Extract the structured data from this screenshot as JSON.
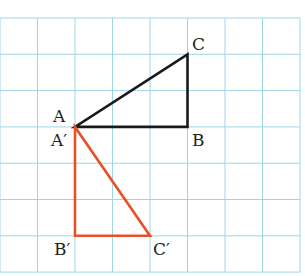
{
  "diagram": {
    "type": "grid-transformation",
    "grid": {
      "columns": 8,
      "rows": 7,
      "origin_px": [
        0,
        18
      ],
      "cell_w": 37.5,
      "cell_h": 36.3,
      "line_color": "#9fd6e6"
    },
    "triangles": [
      {
        "name": "ABC",
        "color": "#1a1a1a",
        "vertices": {
          "A": [
            2,
            3
          ],
          "B": [
            5,
            3
          ],
          "C": [
            5,
            1
          ]
        }
      },
      {
        "name": "A'B'C'",
        "color": "#e8502a",
        "vertices": {
          "A'": [
            2,
            3
          ],
          "B'": [
            2,
            6
          ],
          "C'": [
            4,
            6
          ]
        }
      }
    ],
    "labels": {
      "A": "A",
      "B": "B",
      "C": "C",
      "A_prime": "A′",
      "B_prime": "B′",
      "C_prime": "C′"
    }
  }
}
